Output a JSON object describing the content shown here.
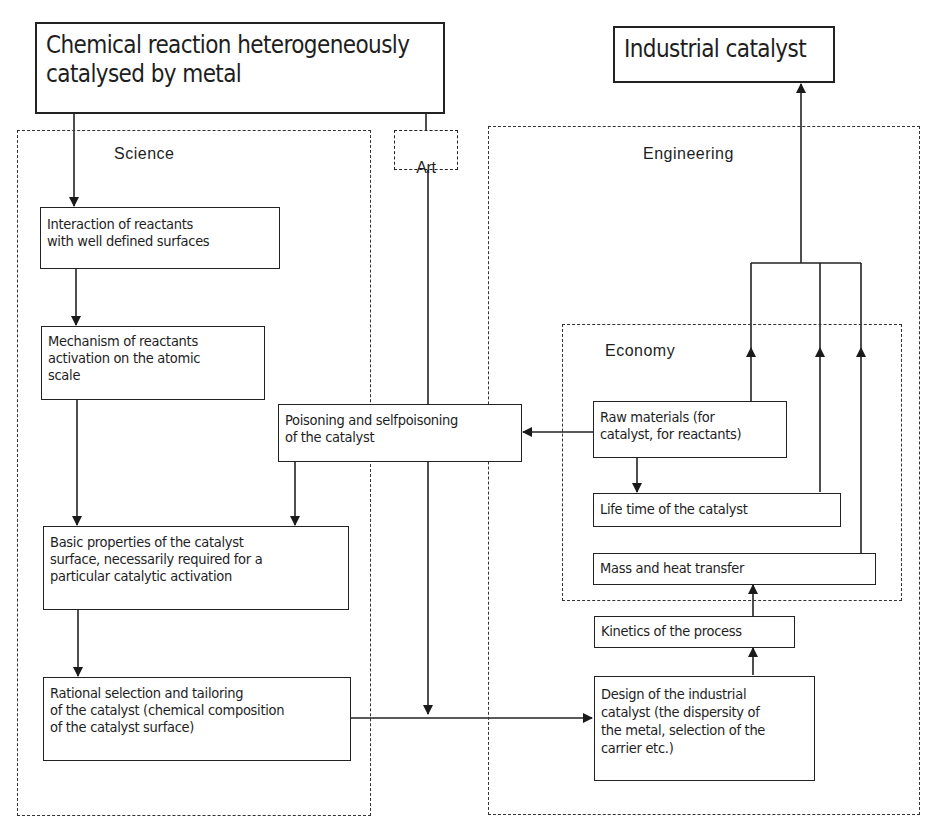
{
  "diagram": {
    "source_node": "Chemical reaction heterogeneously\ncatalysed by metal",
    "target_node": "Industrial catalyst",
    "regions": {
      "science": "Science",
      "art": "Art",
      "engineering": "Engineering",
      "economy": "Economy"
    },
    "science_nodes": [
      "Interaction of reactants\nwith well defined surfaces",
      "Mechanism of reactants\nactivation on the atomic\nscale",
      "Basic properties of the catalyst\nsurface, necessarily required for a\nparticular catalytic activation",
      "Rational selection and tailoring\nof the catalyst (chemical composition\nof the catalyst surface)"
    ],
    "poisoning_node": "Poisoning and selfpoisoning\nof the catalyst",
    "economy_nodes": [
      "Raw materials (for\ncatalyst, for reactants)",
      "Life time of the catalyst",
      "Mass and heat transfer"
    ],
    "engineering_nodes": [
      "Kinetics of the process",
      "Design of the industrial\ncatalyst (the dispersity of\nthe metal, selection of the\ncarrier etc.)"
    ],
    "edges": [
      [
        "source_node",
        "science_nodes.0"
      ],
      [
        "source_node",
        "art"
      ],
      [
        "science_nodes.0",
        "science_nodes.1"
      ],
      [
        "science_nodes.1",
        "science_nodes.2"
      ],
      [
        "poisoning_node",
        "science_nodes.2"
      ],
      [
        "science_nodes.2",
        "science_nodes.3"
      ],
      [
        "science_nodes.3",
        "engineering_nodes.1"
      ],
      [
        "art",
        "engineering_nodes.1"
      ],
      [
        "economy_nodes.0",
        "poisoning_node"
      ],
      [
        "economy_nodes.0",
        "economy_nodes.1"
      ],
      [
        "engineering_nodes.1",
        "engineering_nodes.0"
      ],
      [
        "engineering_nodes.0",
        "economy_nodes.2"
      ],
      [
        "economy_nodes.0",
        "target_node"
      ],
      [
        "economy_nodes.1",
        "target_node"
      ],
      [
        "economy_nodes.2",
        "target_node"
      ]
    ]
  }
}
